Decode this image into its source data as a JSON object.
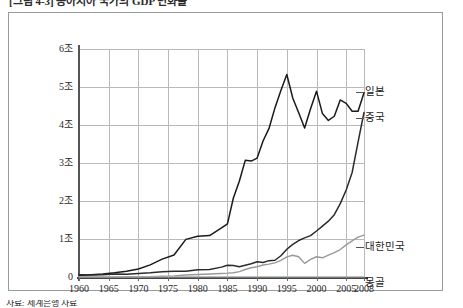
{
  "figure": {
    "title_clipped": "[그림 4-3]  동아시아 국가의 GDP 변화율",
    "source_clipped": "자료: 세계은행 자료"
  },
  "axes": {
    "y_ticks": [
      "6조",
      "5조",
      "4조",
      "3조",
      "2조",
      "1조",
      "0"
    ],
    "x_ticks": [
      "1960",
      "1965",
      "1970",
      "1975",
      "1980",
      "1985",
      "1990",
      "1995",
      "2000",
      "2005",
      "2008"
    ]
  },
  "series_labels": {
    "japan": "일본",
    "china": "중국",
    "korea": "대한민국",
    "mongolia": "몽골"
  },
  "colors": {
    "japan": "#1a1a1a",
    "china": "#2b2b2b",
    "korea": "#999999",
    "mongolia": "#aaaaaa",
    "grid": "#b9b9b9",
    "axis": "#444444",
    "frame": "#9a9a9a"
  },
  "chart_data": {
    "type": "line",
    "title": "[그림 4-3]  동아시아 국가의 GDP 변화율",
    "xlabel": "",
    "ylabel": "",
    "unit": "조",
    "xlim": [
      1960,
      2008
    ],
    "ylim": [
      0,
      6
    ],
    "grid": true,
    "legend": "right-inline",
    "x": [
      1960,
      1962,
      1964,
      1966,
      1968,
      1970,
      1972,
      1974,
      1976,
      1978,
      1980,
      1982,
      1984,
      1985,
      1986,
      1987,
      1988,
      1989,
      1990,
      1991,
      1992,
      1993,
      1994,
      1995,
      1996,
      1997,
      1998,
      1999,
      2000,
      2001,
      2002,
      2003,
      2004,
      2005,
      2006,
      2007,
      2008
    ],
    "series": [
      {
        "name": "일본",
        "color": "#1a1a1a",
        "values": [
          0.04,
          0.06,
          0.08,
          0.11,
          0.15,
          0.21,
          0.32,
          0.47,
          0.58,
          0.99,
          1.07,
          1.09,
          1.29,
          1.4,
          2.08,
          2.52,
          3.07,
          3.05,
          3.13,
          3.58,
          3.91,
          4.45,
          4.91,
          5.33,
          4.71,
          4.32,
          3.92,
          4.43,
          4.89,
          4.3,
          4.12,
          4.23,
          4.66,
          4.57,
          4.36,
          4.36,
          4.85
        ]
      },
      {
        "name": "중국",
        "color": "#2b2b2b",
        "values": [
          0.06,
          0.05,
          0.06,
          0.08,
          0.07,
          0.09,
          0.11,
          0.14,
          0.15,
          0.15,
          0.19,
          0.2,
          0.26,
          0.31,
          0.3,
          0.27,
          0.31,
          0.35,
          0.4,
          0.38,
          0.43,
          0.44,
          0.56,
          0.73,
          0.86,
          0.96,
          1.03,
          1.09,
          1.21,
          1.34,
          1.47,
          1.64,
          1.93,
          2.29,
          2.75,
          3.55,
          4.33
        ]
      },
      {
        "name": "대한민국",
        "color": "#999999",
        "values": [
          0.004,
          0.003,
          0.003,
          0.004,
          0.006,
          0.008,
          0.011,
          0.019,
          0.03,
          0.052,
          0.065,
          0.077,
          0.094,
          0.101,
          0.113,
          0.143,
          0.197,
          0.243,
          0.27,
          0.315,
          0.338,
          0.373,
          0.436,
          0.531,
          0.572,
          0.533,
          0.358,
          0.462,
          0.533,
          0.505,
          0.576,
          0.644,
          0.722,
          0.845,
          0.952,
          1.05,
          1.1
        ]
      },
      {
        "name": "몽골",
        "color": "#aaaaaa",
        "values": [
          0.001,
          0.001,
          0.001,
          0.001,
          0.001,
          0.001,
          0.001,
          0.002,
          0.002,
          0.002,
          0.002,
          0.002,
          0.002,
          0.002,
          0.002,
          0.002,
          0.002,
          0.002,
          0.002,
          0.002,
          0.002,
          0.002,
          0.001,
          0.002,
          0.002,
          0.002,
          0.001,
          0.001,
          0.001,
          0.001,
          0.001,
          0.002,
          0.002,
          0.003,
          0.003,
          0.004,
          0.005
        ]
      }
    ]
  }
}
